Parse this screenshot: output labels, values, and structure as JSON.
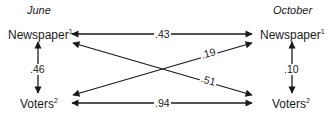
{
  "periods": {
    "left": "June",
    "right": "October"
  },
  "nodes": {
    "june_newspaper": {
      "label": "Newspaper",
      "superscript": "1"
    },
    "june_voters": {
      "label": "Voters",
      "superscript": "2"
    },
    "october_newspaper": {
      "label": "Newspaper",
      "superscript": "1"
    },
    "october_voters": {
      "label": "Voters",
      "superscript": "2"
    }
  },
  "edges": [
    {
      "from": "june_newspaper",
      "to": "october_newspaper",
      "coefficient": ".43",
      "bidirectional": true
    },
    {
      "from": "june_voters",
      "to": "october_newspaper",
      "coefficient": ".19",
      "bidirectional": true
    },
    {
      "from": "june_newspaper",
      "to": "october_voters",
      "coefficient": ".51",
      "bidirectional": true
    },
    {
      "from": "june_voters",
      "to": "october_voters",
      "coefficient": ".94",
      "bidirectional": true
    },
    {
      "from": "june_newspaper",
      "to": "june_voters",
      "coefficient": ".46",
      "bidirectional": true
    },
    {
      "from": "october_newspaper",
      "to": "october_voters",
      "coefficient": ".10",
      "bidirectional": true
    }
  ],
  "colors": {
    "line": "#1a1a1a",
    "background": "#ffffff"
  }
}
